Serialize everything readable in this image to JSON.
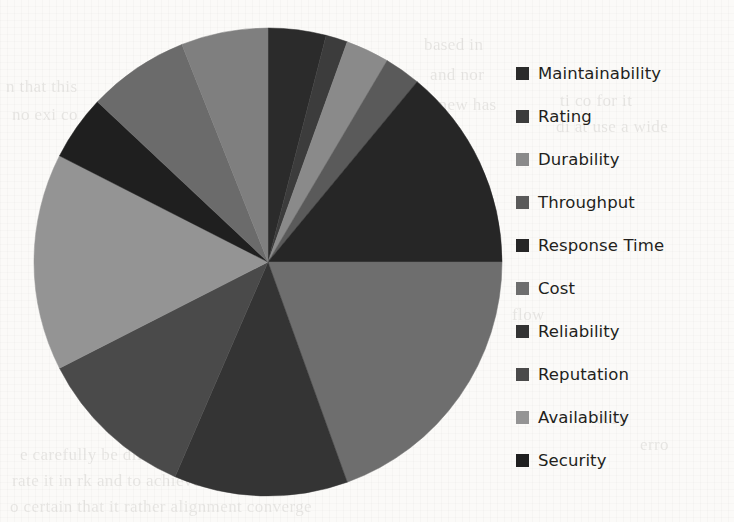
{
  "chart_data": {
    "type": "pie",
    "title": "",
    "subtitle": "",
    "xlabel": "",
    "ylabel": "",
    "legend_position": "right",
    "grid": false,
    "start_angle_deg": 0,
    "direction": "clockwise",
    "categories": [
      "Maintainability",
      "Rating",
      "Durability",
      "Throughput",
      "Response Time",
      "Cost",
      "Reliability",
      "Reputation",
      "Availability",
      "Security"
    ],
    "values": [
      4.0,
      1.5,
      3.0,
      2.5,
      14.0,
      19.5,
      12.0,
      11.0,
      15.0,
      4.5
    ],
    "extra_values": [
      7.0,
      6.0
    ],
    "slices": [
      {
        "label": "Maintainability",
        "value": 4.0,
        "percent": 4.0,
        "start_deg": 0.0,
        "end_deg": 14.4,
        "color": "#2b2b2b"
      },
      {
        "label": "Rating",
        "value": 1.5,
        "percent": 1.5,
        "start_deg": 14.4,
        "end_deg": 19.8,
        "color": "#3c3c3c"
      },
      {
        "label": "Durability",
        "value": 3.0,
        "percent": 3.0,
        "start_deg": 19.8,
        "end_deg": 30.6,
        "color": "#8a8a8a"
      },
      {
        "label": "Throughput",
        "value": 2.5,
        "percent": 2.5,
        "start_deg": 30.6,
        "end_deg": 39.6,
        "color": "#5a5a5a"
      },
      {
        "label": "Response Time",
        "value": 14.0,
        "percent": 14.0,
        "start_deg": 39.6,
        "end_deg": 90.0,
        "color": "#262626"
      },
      {
        "label": "Cost",
        "value": 19.5,
        "percent": 19.5,
        "start_deg": 90.0,
        "end_deg": 160.2,
        "color": "#6e6e6e"
      },
      {
        "label": "Reliability",
        "value": 12.0,
        "percent": 12.0,
        "start_deg": 160.2,
        "end_deg": 203.4,
        "color": "#343434"
      },
      {
        "label": "Reputation",
        "value": 11.0,
        "percent": 11.0,
        "start_deg": 203.4,
        "end_deg": 243.0,
        "color": "#4a4a4a"
      },
      {
        "label": "Availability",
        "value": 15.0,
        "percent": 15.0,
        "start_deg": 243.0,
        "end_deg": 297.0,
        "color": "#949494"
      },
      {
        "label": "Security",
        "value": 4.5,
        "percent": 4.5,
        "start_deg": 297.0,
        "end_deg": 313.2,
        "color": "#1f1f1f"
      },
      {
        "label": "",
        "value": 7.0,
        "percent": 7.0,
        "start_deg": 313.2,
        "end_deg": 338.4,
        "color": "#6b6b6b"
      },
      {
        "label": "",
        "value": 6.0,
        "percent": 6.0,
        "start_deg": 338.4,
        "end_deg": 360.0,
        "color": "#7f7f7f"
      }
    ],
    "geometry": {
      "center_x": 236,
      "center_y": 238,
      "radius": 234
    }
  },
  "legend": {
    "items": [
      {
        "label": "Maintainability",
        "color": "#2b2b2b",
        "swatch": "legend-swatch-icon"
      },
      {
        "label": "Rating",
        "color": "#3c3c3c",
        "swatch": "legend-swatch-icon"
      },
      {
        "label": "Durability",
        "color": "#8a8a8a",
        "swatch": "legend-swatch-icon"
      },
      {
        "label": "Throughput",
        "color": "#5a5a5a",
        "swatch": "legend-swatch-icon"
      },
      {
        "label": "Response Time",
        "color": "#262626",
        "swatch": "legend-swatch-icon"
      },
      {
        "label": "Cost",
        "color": "#6e6e6e",
        "swatch": "legend-swatch-icon"
      },
      {
        "label": "Reliability",
        "color": "#343434",
        "swatch": "legend-swatch-icon"
      },
      {
        "label": "Reputation",
        "color": "#4a4a4a",
        "swatch": "legend-swatch-icon"
      },
      {
        "label": "Availability",
        "color": "#949494",
        "swatch": "legend-swatch-icon"
      },
      {
        "label": "Security",
        "color": "#1f1f1f",
        "swatch": "legend-swatch-icon"
      }
    ]
  },
  "background": {
    "note": "scanned book page showing faint bleed-through text",
    "ghost_lines": [
      {
        "text": "based in",
        "x": 424,
        "y": 30
      },
      {
        "text": "and nor",
        "x": 430,
        "y": 60
      },
      {
        "text": "a new has",
        "x": 426,
        "y": 90
      },
      {
        "text": "n that this",
        "x": 6,
        "y": 72
      },
      {
        "text": "ti co   for it",
        "x": 560,
        "y": 86
      },
      {
        "text": "no exi co",
        "x": 12,
        "y": 100
      },
      {
        "text": "di  at   use a wide",
        "x": 556,
        "y": 112
      },
      {
        "text": "flow",
        "x": 512,
        "y": 300
      },
      {
        "text": "0.10",
        "x": 596,
        "y": 404
      },
      {
        "text": "erro",
        "x": 640,
        "y": 430
      },
      {
        "text": "e carefully be different and",
        "x": 20,
        "y": 440
      },
      {
        "text": "rate it in   rk and  to achieve this has",
        "x": 12,
        "y": 466
      },
      {
        "text": "o  certain  that it rather alignment converge",
        "x": 10,
        "y": 492
      }
    ]
  }
}
